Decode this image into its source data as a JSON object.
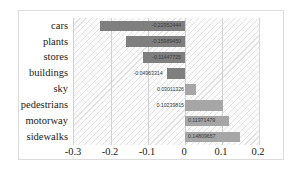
{
  "chart_data": {
    "type": "bar",
    "orientation": "horizontal",
    "title": "",
    "xlabel": "",
    "ylabel": "",
    "xlim": [
      -0.3,
      0.2
    ],
    "grid": true,
    "legend": false,
    "categories": [
      "cars",
      "plants",
      "stores",
      "buildings",
      "sky",
      "pedestrians",
      "motorway",
      "sidewalks"
    ],
    "values": [
      -0.22952444,
      -0.1598945,
      -0.11447725,
      -0.04963314,
      0.03011326,
      0.10239815,
      0.11971479,
      0.14809657
    ],
    "data_labels": [
      "-0.22952444",
      "-0.15989450",
      "-0.11447725",
      "-0.04963314",
      "0.03011326",
      "0.10239815",
      "0.11971479",
      "0.14809657"
    ],
    "x_ticks": [
      -0.3,
      -0.2,
      -0.1,
      0,
      0.1,
      0.2
    ],
    "x_tick_labels": [
      "-0.3",
      "-0.2",
      "-0.1",
      "0",
      "0.1",
      "0.2"
    ],
    "colors": {
      "negative_bar": "#7f7f7f",
      "positive_bar": "#a6a6a6",
      "plot_background": "#fbfbfb",
      "hatch": "#e3e3e3",
      "gridline": "#d2d2d2",
      "frame_border": "#dcdcdc",
      "text": "#1a1a1a"
    }
  }
}
